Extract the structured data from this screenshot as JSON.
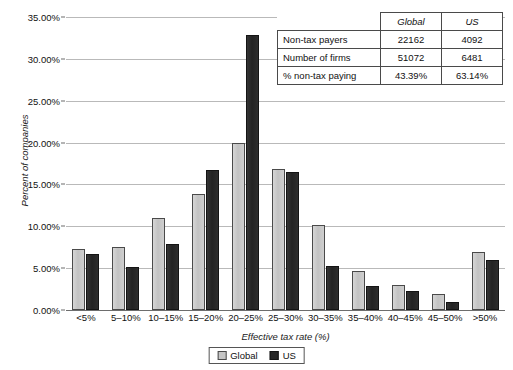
{
  "chart_data": {
    "type": "bar",
    "title": "",
    "xlabel": "Effective tax rate (%)",
    "ylabel": "Percent of companies",
    "categories": [
      "<5%",
      "5–10%",
      "10–15%",
      "15–20%",
      "20–25%",
      "25–30%",
      "30–35%",
      "35–40%",
      "40–45%",
      "45–50%",
      ">50%"
    ],
    "series": [
      {
        "name": "Global",
        "color": "#c6c6c6",
        "values": [
          7.3,
          7.5,
          11.0,
          13.8,
          19.9,
          16.9,
          10.1,
          4.7,
          3.0,
          1.9,
          6.9
        ]
      },
      {
        "name": "US",
        "color": "#262626",
        "values": [
          6.7,
          5.1,
          7.9,
          16.7,
          32.8,
          16.5,
          5.3,
          2.9,
          2.3,
          1.0,
          6.0
        ]
      }
    ],
    "ylim": [
      0,
      35
    ],
    "ytick_values": [
      0,
      5,
      10,
      15,
      20,
      25,
      30,
      35
    ],
    "ytick_labels": [
      "0.00%",
      "5.00%",
      "10.00%",
      "15.00%",
      "20.00%",
      "25.00%",
      "30.00%",
      "35.00%"
    ],
    "grid": true,
    "legend_position": "bottom"
  },
  "legend": {
    "items": [
      {
        "label": "Global"
      },
      {
        "label": "US"
      }
    ]
  },
  "table": {
    "column_headers": [
      "",
      "Global",
      "US"
    ],
    "rows": [
      {
        "label": "Non-tax payers",
        "global": "22162",
        "us": "4092"
      },
      {
        "label": "Number of firms",
        "global": "51072",
        "us": "6481"
      },
      {
        "label": "% non-tax paying",
        "global": "43.39%",
        "us": "63.14%"
      }
    ]
  }
}
